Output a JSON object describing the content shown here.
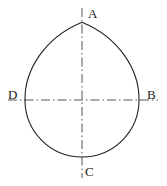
{
  "figure": {
    "background_color": "#ffffff",
    "outline_color": "#222222",
    "centerline_color": "#444444",
    "label_color": "#1a1a1a",
    "outline_width": 1.1,
    "centerline_width": 0.9,
    "geometry": {
      "center_x": 82,
      "center_y": 100,
      "radius": 57,
      "apex_x": 82,
      "apex_y": 22
    },
    "labels": {
      "apex": "A",
      "right": "B",
      "bottom": "C",
      "left": "D"
    },
    "points": {
      "A": {
        "x": 82,
        "y": 22
      },
      "B": {
        "x": 139,
        "y": 100
      },
      "C": {
        "x": 82,
        "y": 157
      },
      "D": {
        "x": 25,
        "y": 100
      }
    },
    "centerlines": {
      "vertical": {
        "x": 82,
        "y_start": 8,
        "y_end": 178
      },
      "horizontal": {
        "y": 100,
        "x_start": 8,
        "x_end": 158
      },
      "dash_pattern": "9,3,1.5,3"
    },
    "outline_path": "M 25 100 A 57 57 0 0 0 139 100 M 139 100 C 139 68 118 36 82 22 C 46 36 25 68 25 100 Z"
  }
}
